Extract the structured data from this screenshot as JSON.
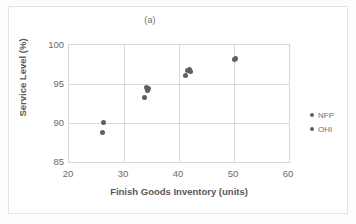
{
  "figure": {
    "title": "(a)",
    "background_color": "#ffffff",
    "border_color": "#e3e3e3"
  },
  "legend": {
    "position": "right",
    "entries": [
      {
        "label": "NFP",
        "color": "#5f5f5f",
        "marker": "circle-dot"
      },
      {
        "label": "OHI",
        "color": "#5f5f5f",
        "marker": "circle-dot"
      }
    ]
  },
  "axes": {
    "x": {
      "label": "Finish Goods Inventory (units)",
      "ticks": [
        "20",
        "30",
        "40",
        "50",
        "60"
      ],
      "min": 20,
      "max": 60
    },
    "y": {
      "label": "Service Level (%)",
      "ticks": [
        "100",
        "95",
        "90",
        "85"
      ],
      "min": 85,
      "max": 100
    }
  },
  "chart_data": {
    "type": "scatter",
    "title": "(a)",
    "xlabel": "Finish Goods Inventory (units)",
    "ylabel": "Service Level (%)",
    "xlim": [
      20,
      60
    ],
    "ylim": [
      85,
      100
    ],
    "xticks": [
      20,
      30,
      40,
      50,
      60
    ],
    "yticks": [
      85,
      90,
      95,
      100
    ],
    "grid": true,
    "legend_position": "right",
    "marker_color": "#5f5f5f",
    "series": [
      {
        "name": "NFP",
        "color": "#5f5f5f",
        "points": [
          {
            "x": 26.3,
            "y": 90.1
          },
          {
            "x": 34.0,
            "y": 94.6
          },
          {
            "x": 34.4,
            "y": 94.4
          },
          {
            "x": 41.9,
            "y": 96.8
          },
          {
            "x": 42.1,
            "y": 96.6
          },
          {
            "x": 50.3,
            "y": 98.3
          }
        ]
      },
      {
        "name": "OHI",
        "color": "#5f5f5f",
        "points": [
          {
            "x": 26.0,
            "y": 88.8
          },
          {
            "x": 33.8,
            "y": 93.3
          },
          {
            "x": 34.2,
            "y": 94.2
          },
          {
            "x": 41.1,
            "y": 96.1
          },
          {
            "x": 41.6,
            "y": 96.7
          },
          {
            "x": 50.0,
            "y": 98.1
          }
        ]
      }
    ]
  }
}
